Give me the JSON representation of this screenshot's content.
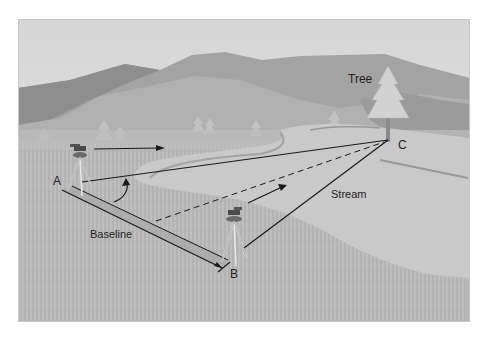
{
  "figure": {
    "labels": {
      "tree": "Tree",
      "point_a": "A",
      "point_b": "B",
      "point_c": "C",
      "baseline": "Baseline",
      "stream": "Stream"
    },
    "colors": {
      "sky": "#dedede",
      "mountain_far": "#9a9a9a",
      "mountain_near": "#a9a9a9",
      "water": "#c7c7c7",
      "grass": "#b8b8b8",
      "lines": "#1a1a1a"
    },
    "points": {
      "A": [
        62,
        190
      ],
      "B": [
        222,
        268
      ],
      "C": [
        388,
        140
      ]
    }
  }
}
